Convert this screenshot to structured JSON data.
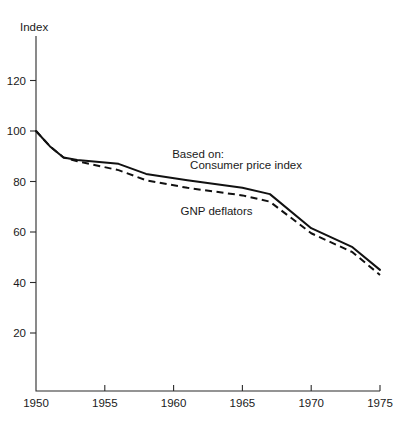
{
  "chart_data": {
    "type": "line",
    "title": "",
    "subtitle": "",
    "xlabel": "",
    "ylabel": "Index",
    "xlim": [
      1950,
      1975
    ],
    "ylim": [
      13,
      128
    ],
    "grid": false,
    "legend_position": "inline-annotations",
    "x_ticks": [
      "1950",
      "1955",
      "1960",
      "1965",
      "1970",
      "1975"
    ],
    "x_tick_values": [
      1950,
      1955,
      1960,
      1965,
      1970,
      1975
    ],
    "y_ticks": [
      "20",
      "40",
      "60",
      "80",
      "100",
      "120"
    ],
    "y_tick_values": [
      20,
      40,
      60,
      80,
      100,
      120
    ],
    "annotations": [
      {
        "text": "Based on:",
        "x": 1959.9,
        "y": 89.5
      },
      {
        "text": "Consumer price index",
        "x": 1961.2,
        "y": 84.8
      },
      {
        "text": "GNP deflators",
        "x": 1960.5,
        "y": 66.6
      }
    ],
    "series": [
      {
        "name": "Consumer price index",
        "style": "solid",
        "x": [
          1950,
          1951,
          1952,
          1953,
          1956,
          1958,
          1961,
          1965,
          1967,
          1970,
          1973,
          1975
        ],
        "values": [
          100,
          94,
          89.5,
          88.5,
          87,
          83,
          80.5,
          77.5,
          75,
          61.5,
          54,
          45
        ]
      },
      {
        "name": "GNP deflators",
        "style": "dashed",
        "x": [
          1950,
          1951,
          1952,
          1953,
          1956,
          1958,
          1961,
          1965,
          1967,
          1970,
          1973,
          1975
        ],
        "values": [
          100,
          94,
          89.5,
          88,
          84.5,
          80.5,
          77.5,
          74.5,
          72,
          59.5,
          52,
          43
        ]
      }
    ]
  },
  "colors": {
    "axis": "#2b2b2b",
    "series": "#111111",
    "background": "#ffffff"
  }
}
